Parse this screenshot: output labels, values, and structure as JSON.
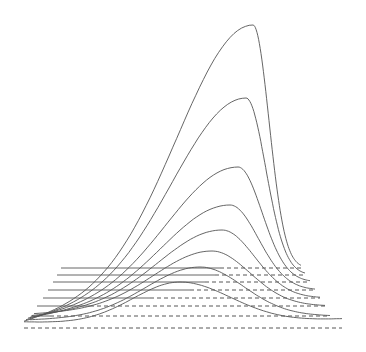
{
  "chart_data": {
    "type": "line",
    "subtype": "waterfall-3d",
    "title": "",
    "xlabel": "",
    "ylabel": "",
    "grid": false,
    "legend": null,
    "colors": {
      "curve": "#555555",
      "baseline_solid": "#555555",
      "baseline_dashed": "#444444",
      "background": "#ffffff"
    },
    "note": "Stacked perspective plot of 8 unimodal curves; each peak becomes taller and narrower going back in depth. Pixel coordinates are given in image space.",
    "series": [
      {
        "name": "curve-1",
        "baseline": {
          "y": 268,
          "x_start": 61,
          "x_end": 301,
          "dash_from": 220
        },
        "peak": {
          "x": 253,
          "y": 25
        },
        "tail_left": {
          "x": 24,
          "y": 323
        },
        "tail_right": {
          "x": 301,
          "y": 268
        }
      },
      {
        "name": "curve-2",
        "baseline": {
          "y": 275,
          "x_start": 57,
          "x_end": 305,
          "dash_from": 215
        },
        "peak": {
          "x": 246,
          "y": 98
        },
        "tail_left": {
          "x": 26,
          "y": 321
        },
        "tail_right": {
          "x": 305,
          "y": 275
        }
      },
      {
        "name": "curve-3",
        "baseline": {
          "y": 282,
          "x_start": 53,
          "x_end": 310,
          "dash_from": 205
        },
        "peak": {
          "x": 238,
          "y": 167
        },
        "tail_left": {
          "x": 28,
          "y": 319
        },
        "tail_right": {
          "x": 310,
          "y": 282
        }
      },
      {
        "name": "curve-4",
        "baseline": {
          "y": 290,
          "x_start": 48,
          "x_end": 315,
          "dash_from": 190
        },
        "peak": {
          "x": 230,
          "y": 205
        },
        "tail_left": {
          "x": 30,
          "y": 318
        },
        "tail_right": {
          "x": 315,
          "y": 290
        }
      },
      {
        "name": "curve-5",
        "baseline": {
          "y": 298,
          "x_start": 43,
          "x_end": 320,
          "dash_from": 150
        },
        "peak": {
          "x": 222,
          "y": 230
        },
        "tail_left": {
          "x": 32,
          "y": 316
        },
        "tail_right": {
          "x": 320,
          "y": 298
        }
      },
      {
        "name": "curve-6",
        "baseline": {
          "y": 306,
          "x_start": 37,
          "x_end": 325,
          "dash_from": 90
        },
        "peak": {
          "x": 212,
          "y": 251
        },
        "tail_left": {
          "x": 34,
          "y": 314
        },
        "tail_right": {
          "x": 325,
          "y": 306
        }
      },
      {
        "name": "curve-7",
        "baseline": {
          "y": 316,
          "x_start": 31,
          "x_end": 330,
          "dash_from": 50
        },
        "peak": {
          "x": 200,
          "y": 267
        },
        "tail_left": {
          "x": 30,
          "y": 320
        },
        "tail_right": {
          "x": 330,
          "y": 316
        }
      },
      {
        "name": "curve-8",
        "baseline": {
          "y": 328,
          "x_start": 24,
          "x_end": 342,
          "dash_from": 24
        },
        "peak": {
          "x": 180,
          "y": 282
        },
        "tail_left": {
          "x": 24,
          "y": 322
        },
        "tail_right": {
          "x": 342,
          "y": 319
        }
      }
    ]
  }
}
